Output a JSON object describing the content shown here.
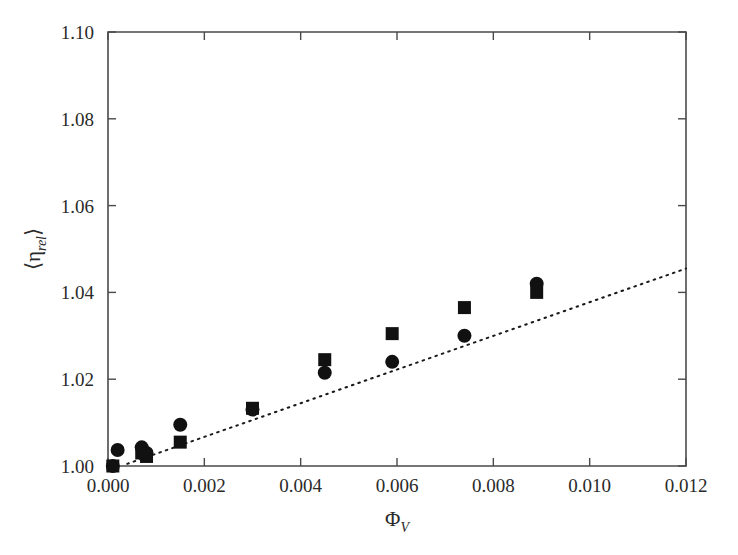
{
  "chart_data": {
    "type": "scatter",
    "title": "",
    "xlabel": "Φ_V",
    "xlabel_main": "Φ",
    "xlabel_sub": "V",
    "ylabel": "⟨η_rel⟩",
    "ylabel_main": "η",
    "ylabel_sub": "rel",
    "xlim": [
      0.0,
      0.012
    ],
    "ylim": [
      1.0,
      1.1
    ],
    "xticks": [
      0.0,
      0.002,
      0.004,
      0.006,
      0.008,
      0.01,
      0.012
    ],
    "xtick_labels": [
      "0.000",
      "0.002",
      "0.004",
      "0.006",
      "0.008",
      "0.010",
      "0.012"
    ],
    "yticks": [
      1.0,
      1.02,
      1.04,
      1.06,
      1.08,
      1.1
    ],
    "ytick_labels": [
      "1.00",
      "1.02",
      "1.04",
      "1.06",
      "1.08",
      "1.10"
    ],
    "grid": false,
    "legend": "none",
    "marker_color": "#111111",
    "axis_color": "#4a4a4a",
    "series": [
      {
        "name": "circles",
        "marker": "circle",
        "x": [
          0.0001,
          0.0002,
          0.0007,
          0.0008,
          0.0015,
          0.003,
          0.0045,
          0.0059,
          0.0074,
          0.0089
        ],
        "y": [
          1.0,
          1.0037,
          1.0043,
          1.003,
          1.0095,
          1.013,
          1.0215,
          1.024,
          1.03,
          1.042
        ]
      },
      {
        "name": "squares",
        "marker": "square",
        "x": [
          0.0001,
          0.0007,
          0.0008,
          0.0015,
          0.003,
          0.0045,
          0.0059,
          0.0074,
          0.0089
        ],
        "y": [
          1.0,
          1.003,
          1.0022,
          1.0055,
          1.0133,
          1.0245,
          1.0305,
          1.0365,
          1.04
        ]
      }
    ],
    "trend": {
      "name": "fit-line",
      "style": "dotted",
      "x": [
        0.0004,
        0.012
      ],
      "y": [
        1.0005,
        1.0455
      ]
    }
  }
}
